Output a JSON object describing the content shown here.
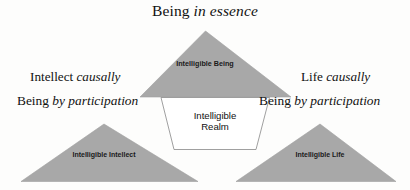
{
  "diagram": {
    "title_plain": "Being ",
    "title_italic": "in essence",
    "colors": {
      "triangle_fill": "#a8a8a8",
      "triangle_stroke": "#9a9a9a",
      "center_outline": "#8f8f8f",
      "background": "#fdfdfc",
      "text": "#111111"
    },
    "captions": {
      "top": {
        "plain": "Being ",
        "italic": "in essence"
      },
      "left_upper": {
        "plain": "Intellect ",
        "italic": "causally"
      },
      "right_upper": {
        "plain": "Life ",
        "italic": "causally"
      },
      "left_lower": {
        "plain": "Being ",
        "italic": "by participation"
      },
      "right_lower": {
        "plain": "Being ",
        "italic": "by participation"
      }
    },
    "shapes": {
      "top_triangle_label": "Intelligible Being",
      "bottom_left_triangle_label": "Intelligible Intellect",
      "bottom_right_triangle_label": "Intelligible Life",
      "center_label_line1": "Intelligible",
      "center_label_line2": "Realm"
    }
  }
}
